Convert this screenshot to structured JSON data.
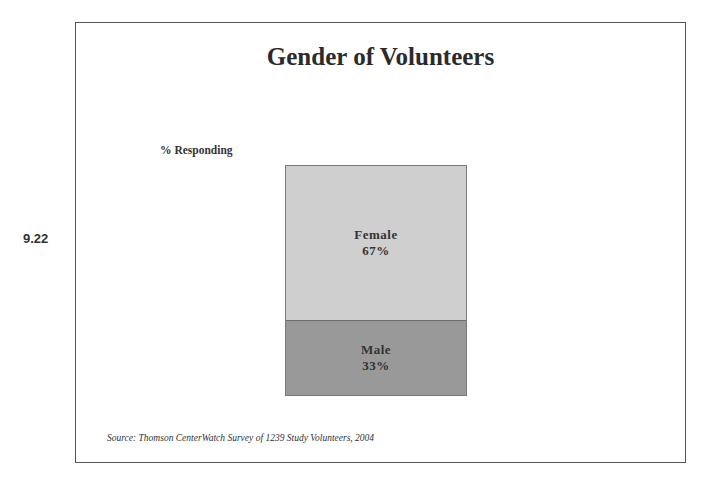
{
  "page": {
    "number": "9.22"
  },
  "chart_data": {
    "type": "bar",
    "stacked": true,
    "title": "Gender of Volunteers",
    "ylabel": "% Responding",
    "xlabel": "",
    "categories": [
      "Volunteers"
    ],
    "series": [
      {
        "name": "Male",
        "values": [
          33
        ],
        "color": "#999999",
        "label": "Male",
        "value_label": "33%"
      },
      {
        "name": "Female",
        "values": [
          67
        ],
        "color": "#cfcfcf",
        "label": "Female",
        "value_label": "67%"
      }
    ],
    "ylim": [
      0,
      100
    ],
    "grid": false,
    "legend": "none (labels inside segments)",
    "source": "Source: Thomson CenterWatch Survey of 1239 Study Volunteers, 2004"
  }
}
